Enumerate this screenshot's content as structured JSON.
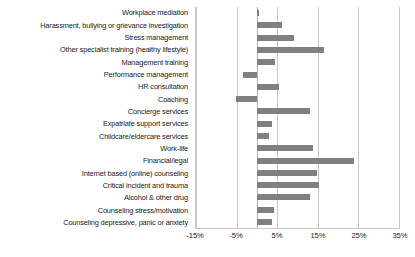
{
  "chart_data": {
    "type": "bar",
    "orientation": "horizontal",
    "title": "",
    "xlabel": "",
    "ylabel": "",
    "xlim": [
      -15,
      35
    ],
    "xticks": [
      -15,
      -5,
      5,
      15,
      25,
      35
    ],
    "xtick_labels": [
      "-15%",
      "-5%",
      "5%",
      "15%",
      "25%",
      "35%"
    ],
    "grid": true,
    "legend": false,
    "bar_color": "#808080",
    "gridline_color": "#c9c9c9",
    "categories": [
      "Workplace mediation",
      "Harassment, bullying or grievance investigation",
      "Stress management",
      "Other specialist training (healthy lifestyle)",
      "Management training",
      "Performance management",
      "HR consultation",
      "Coaching",
      "Concierge services",
      "Expatriate support services",
      "Childcare/eldercare services",
      "Work-life",
      "Financial/legal",
      "Internet based (online) counseling",
      "Critical incident and trauma",
      "Alcohol & other drug",
      "Counseling stress/motivation",
      "Counseling depressive, panic or anxiety"
    ],
    "values": [
      0.6,
      6.2,
      9.1,
      16.5,
      4.5,
      -3.4,
      5.4,
      -5.1,
      13.1,
      3.8,
      2.9,
      13.8,
      23.9,
      14.8,
      15.2,
      13.0,
      4.1,
      3.7
    ]
  }
}
